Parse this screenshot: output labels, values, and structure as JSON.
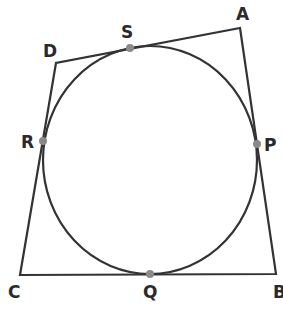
{
  "diagram": {
    "colors": {
      "line": "#333333",
      "point": "#8a8a8a",
      "text": "#2a2a2a"
    },
    "vertices": {
      "A": {
        "label": "A",
        "x": 240,
        "y": 28,
        "lx": 236,
        "ly": 20
      },
      "B": {
        "label": "B",
        "x": 276,
        "y": 274,
        "lx": 273,
        "ly": 298
      },
      "C": {
        "label": "C",
        "x": 20,
        "y": 275,
        "lx": 8,
        "ly": 298
      },
      "D": {
        "label": "D",
        "x": 56,
        "y": 63,
        "lx": 43,
        "ly": 57
      }
    },
    "circle": {
      "cx": 150,
      "cy": 160,
      "rx": 107,
      "ry": 114
    },
    "tangent_points": {
      "S": {
        "label": "S",
        "x": 130,
        "y": 48,
        "lx": 121,
        "ly": 38
      },
      "R": {
        "label": "R",
        "x": 43,
        "y": 141,
        "lx": 21,
        "ly": 148
      },
      "P": {
        "label": "P",
        "x": 257,
        "y": 144,
        "lx": 264,
        "ly": 151
      },
      "Q": {
        "label": "Q",
        "x": 150,
        "y": 274,
        "lx": 143,
        "ly": 298
      }
    }
  }
}
